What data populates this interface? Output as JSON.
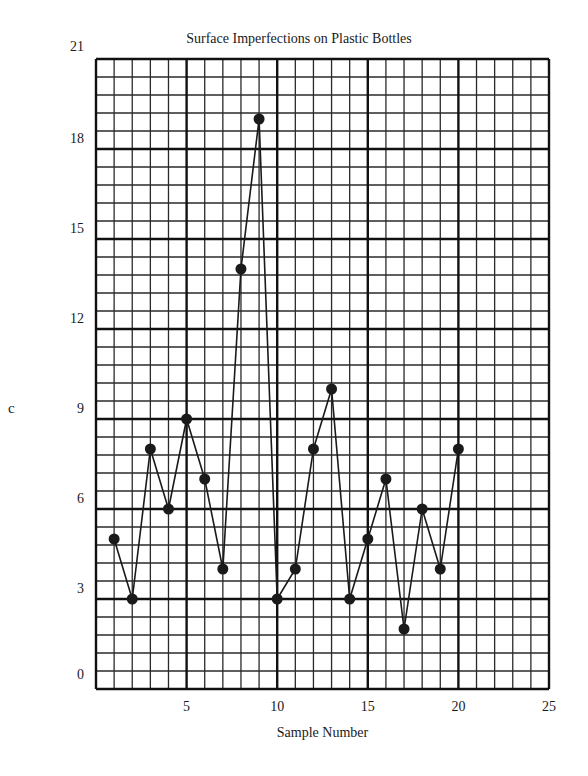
{
  "chart_data": {
    "type": "line",
    "title": "Surface Imperfections on Plastic Bottles",
    "xlabel": "Sample Number",
    "ylabel": "c",
    "x": [
      1,
      2,
      3,
      4,
      5,
      6,
      7,
      8,
      9,
      10,
      11,
      12,
      13,
      14,
      15,
      16,
      17,
      18,
      19,
      20
    ],
    "series": [
      {
        "name": "c",
        "values": [
          5,
          3,
          8,
          6,
          9,
          7,
          4,
          14,
          19,
          3,
          4,
          8,
          10,
          3,
          5,
          7,
          2,
          6,
          4,
          8
        ]
      }
    ],
    "xlim": [
      0,
      25
    ],
    "ylim": [
      0,
      21
    ],
    "xticks": [
      5,
      10,
      15,
      20,
      25
    ],
    "yticks": [
      0,
      3,
      6,
      9,
      12,
      15,
      18,
      21
    ],
    "grid": true,
    "grid_minor_x_step": 1,
    "grid_major_x_step": 5,
    "grid_minor_y_step": 0.6,
    "grid_major_y_step": 3,
    "legend": "none",
    "marker": "filled-circle"
  },
  "style": {
    "line_color": "#1a1a1a",
    "marker_color": "#1a1a1a",
    "grid_minor_color": "#2a2a2a",
    "grid_major_color": "#111111",
    "background": "#ffffff"
  }
}
